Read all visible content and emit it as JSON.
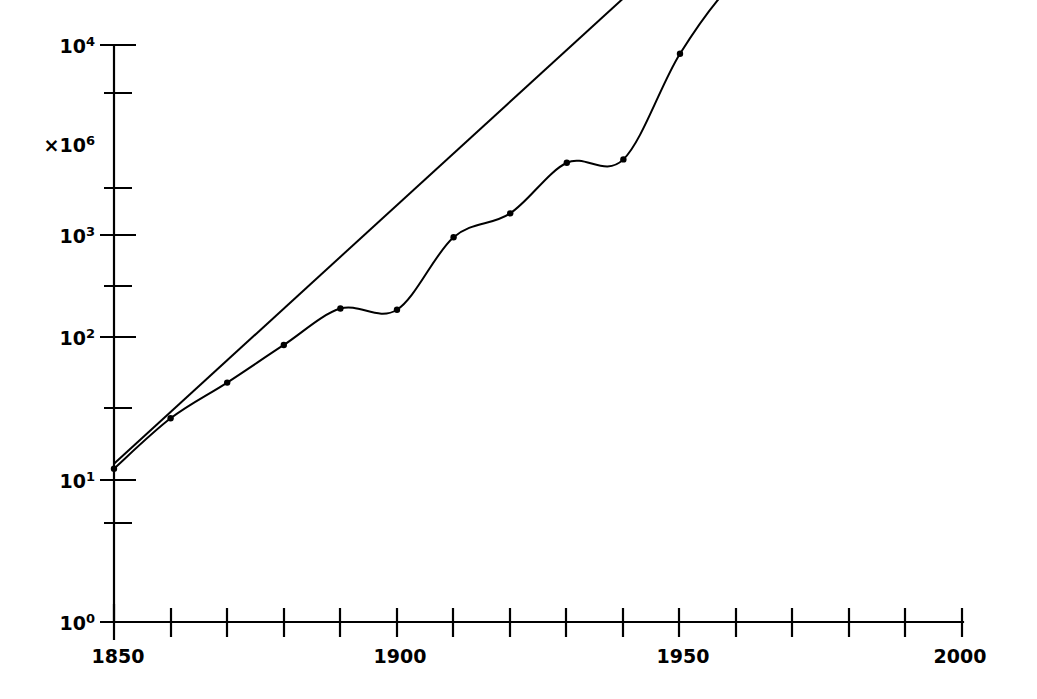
{
  "chart_data": {
    "type": "line",
    "title": "",
    "subtitle": "",
    "xlabel": "",
    "ylabel": "",
    "xlim": [
      1850,
      2000
    ],
    "ylim_exponent": [
      0,
      4
    ],
    "yscale": "log",
    "y_axis_annotation": "×10⁶",
    "y_axis_annotation_base": "×10",
    "y_axis_annotation_exp": "6",
    "grid": false,
    "legend": "none",
    "x_ticks": [
      1850,
      1860,
      1870,
      1880,
      1890,
      1900,
      1910,
      1920,
      1930,
      1940,
      1950,
      1960,
      1970,
      1980,
      1990,
      2000
    ],
    "x_tick_labels": [
      "1850",
      "",
      "",
      "",
      "",
      "1900",
      "",
      "",
      "",
      "",
      "1950",
      "",
      "",
      "",
      "",
      "2000"
    ],
    "x_labeled_ticks": [
      {
        "value": 1850,
        "label": "1850"
      },
      {
        "value": 1900,
        "label": "1900"
      },
      {
        "value": 1950,
        "label": "1950"
      },
      {
        "value": 2000,
        "label": "2000"
      }
    ],
    "y_ticks": [
      {
        "exponent": 0,
        "label_base": "10",
        "label_exp": "0"
      },
      {
        "exponent": 1,
        "label_base": "10",
        "label_exp": "1"
      },
      {
        "exponent": 2,
        "label_base": "10",
        "label_exp": "2"
      },
      {
        "exponent": 3,
        "label_base": "10",
        "label_exp": "3"
      },
      {
        "exponent": 4,
        "label_base": "10",
        "label_exp": "4"
      }
    ],
    "y_minor_ticks": [
      0.5,
      1.5,
      2.5,
      3.5
    ],
    "series": [
      {
        "name": "data-curve",
        "style": "smooth-with-markers",
        "markers": true,
        "x": [
          1850,
          1860,
          1870,
          1880,
          1890,
          1900,
          1910,
          1920,
          1930,
          1940,
          1950,
          1960,
          1970
        ],
        "y": [
          12,
          27,
          48,
          88,
          190,
          185,
          950,
          1300,
          2400,
          2500,
          9000,
          22000,
          31000
        ]
      },
      {
        "name": "trend-line",
        "style": "straight",
        "markers": false,
        "x": [
          1850,
          1950
        ],
        "y": [
          13,
          33000
        ]
      }
    ]
  },
  "geometry": {
    "plot_left": 114,
    "plot_right": 963,
    "axis_top": 45,
    "axis_bottom": 622,
    "note": "pixel anchors used to reproduce the original non-uniform log spacing"
  }
}
